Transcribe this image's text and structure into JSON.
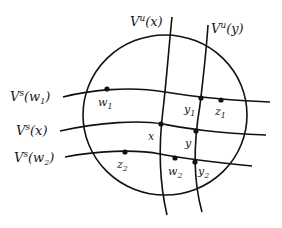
{
  "diagram": {
    "type": "local product structure",
    "region": {
      "shape": "circle",
      "cx": 165,
      "cy": 115,
      "rx": 82,
      "ry": 80
    },
    "unstable_manifolds": [
      {
        "id": "Vu_x",
        "label": "V",
        "sup": "u",
        "arg": "x",
        "path": "M172,17 C169,45 167,75 163,110 C158,150 160,185 167,215"
      },
      {
        "id": "Vu_y",
        "label": "V",
        "sup": "u",
        "arg": "y",
        "path": "M208,25 C206,55 203,80 200,105 C194,140 193,180 202,212"
      }
    ],
    "stable_manifolds": [
      {
        "id": "Vs_w1",
        "label": "V",
        "sup": "s",
        "arg": "w",
        "argsub": "1",
        "path": "M63,97 C90,90 130,86 165,92 C195,97 220,100 270,102"
      },
      {
        "id": "Vs_x",
        "label": "V",
        "sup": "s",
        "arg": "x",
        "argsub": "",
        "path": "M60,131 C100,122 140,120 163,124 C185,128 210,133 266,135"
      },
      {
        "id": "Vs_w2",
        "label": "V",
        "sup": "s",
        "arg": "w",
        "argsub": "2",
        "path": "M65,157 C95,151 135,149 160,154 C180,158 210,162 252,166"
      }
    ],
    "points": [
      {
        "name": "w",
        "sub": "1",
        "x": 107,
        "y": 89,
        "lx": 98,
        "ly": 106
      },
      {
        "name": "y",
        "sub": "1",
        "x": 201,
        "y": 98,
        "lx": 184,
        "ly": 113
      },
      {
        "name": "z",
        "sub": "1",
        "x": 221,
        "y": 100,
        "lx": 215,
        "ly": 115
      },
      {
        "name": "x",
        "sub": "",
        "x": 161,
        "y": 124,
        "lx": 148,
        "ly": 140
      },
      {
        "name": "y",
        "sub": "",
        "x": 196,
        "y": 131,
        "lx": 185,
        "ly": 147
      },
      {
        "name": "z",
        "sub": "2",
        "x": 125,
        "y": 152,
        "lx": 117,
        "ly": 168
      },
      {
        "name": "w",
        "sub": "2",
        "x": 175,
        "y": 158,
        "lx": 168,
        "ly": 175
      },
      {
        "name": "y",
        "sub": "2",
        "x": 195,
        "y": 162,
        "lx": 198,
        "ly": 175
      }
    ],
    "labels": {
      "Vu_x": {
        "text": "V",
        "sup": "u",
        "arg": "(x)",
        "x": 130,
        "y": 26
      },
      "Vu_y": {
        "text": "V",
        "sup": "u",
        "arg": "(y)",
        "x": 211,
        "y": 33
      },
      "Vs_w1": {
        "text": "V",
        "sup": "s",
        "arg": "(w",
        "argsub": "1",
        "close": ")",
        "x": 10,
        "y": 101
      },
      "Vs_x": {
        "text": "V",
        "sup": "s",
        "arg": "(x)",
        "x": 16,
        "y": 135
      },
      "Vs_w2": {
        "text": "V",
        "sup": "s",
        "arg": "(w",
        "argsub": "2",
        "close": ")",
        "x": 14,
        "y": 162
      }
    }
  }
}
